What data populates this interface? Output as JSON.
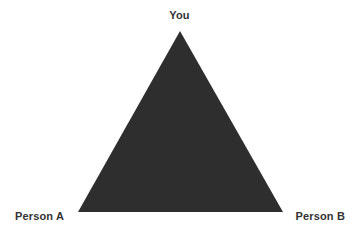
{
  "diagram": {
    "type": "triangle-relationship-diagram",
    "background_color": "#ffffff",
    "shape": {
      "name": "filled-triangle",
      "fill_color": "#2f2f2f",
      "vertices": {
        "top": {
          "x": 180,
          "y": 31
        },
        "bottom_left": {
          "x": 78,
          "y": 212
        },
        "bottom_right": {
          "x": 283,
          "y": 212
        }
      }
    },
    "labels": {
      "top": "You",
      "bottom_left": "Person A",
      "bottom_right": "Person B",
      "text_color": "#333333"
    }
  }
}
